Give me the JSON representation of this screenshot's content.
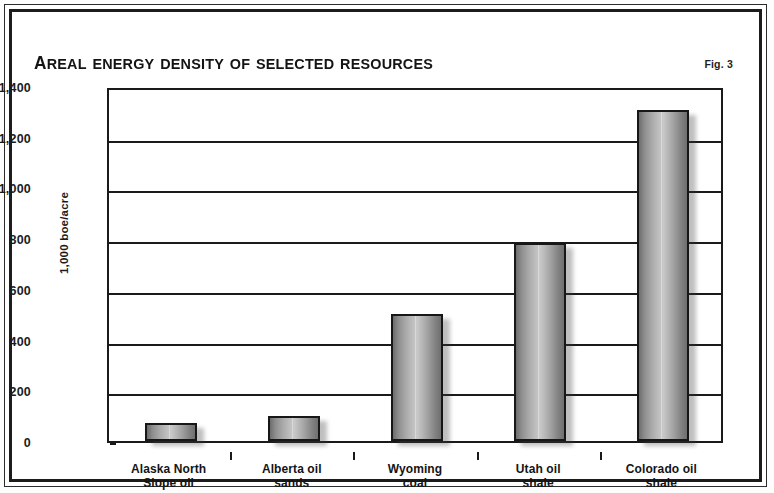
{
  "figure": {
    "title": "Areal energy density of selected resources",
    "figure_label": "Fig. 3"
  },
  "chart_data": {
    "type": "bar",
    "title": "Areal energy density of selected resources",
    "xlabel": "",
    "ylabel": "1,000 boe/acre",
    "ylim": [
      0,
      1400
    ],
    "ytick_values": [
      0,
      200,
      400,
      600,
      800,
      1000,
      1200,
      1400
    ],
    "ytick_labels": [
      "0",
      "200",
      "400",
      "600",
      "800",
      "1,000",
      "1,200",
      "1,400"
    ],
    "grid": true,
    "legend": null,
    "categories": [
      "Alaska North Slope oil",
      "Alberta oil sands",
      "Wyoming coal",
      "Utah oil shale",
      "Colorado oil shale"
    ],
    "category_lines": [
      [
        "Alaska North",
        "Slope oil"
      ],
      [
        "Alberta oil",
        "sands"
      ],
      [
        "Wyoming",
        "coal"
      ],
      [
        "Utah oil",
        "shale"
      ],
      [
        "Colorado oil",
        "shale"
      ]
    ],
    "values": [
      70,
      100,
      500,
      780,
      1305
    ],
    "bar_color": "#a8a8a8",
    "bar_edge_color": "#171717"
  }
}
